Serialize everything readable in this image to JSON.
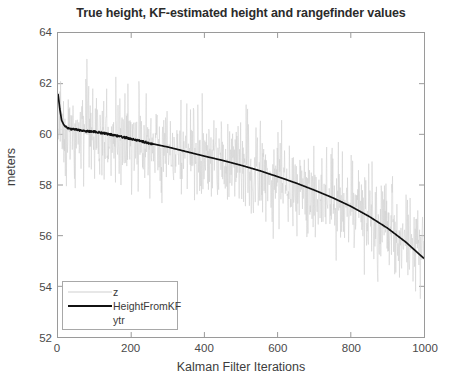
{
  "chart_data": {
    "type": "line",
    "title": "True height, KF-estimated height and rangefinder values",
    "xlabel": "Kalman Filter Iterations",
    "ylabel": "meters",
    "xlim": [
      0,
      1000
    ],
    "ylim": [
      52,
      64
    ],
    "xticks": [
      0,
      200,
      400,
      600,
      800,
      1000
    ],
    "yticks": [
      52,
      54,
      56,
      58,
      60,
      62,
      64
    ],
    "grid": false,
    "legend_position": "lower-left",
    "legend": [
      {
        "label": "z",
        "color": "#cfcfcf",
        "width": 1
      },
      {
        "label": "HeightFromKF",
        "color": "#111111",
        "width": 2
      },
      {
        "label": "ytr",
        "color": "#ffffff",
        "width": 1
      }
    ],
    "series": [
      {
        "name": "z",
        "role": "rangefinder-measurements",
        "color": "#cfcfcf",
        "description": "Noisy rangefinder samples scattered about the true height, spread roughly +/- 1.6 m, densest near the true curve.",
        "noise_sigma": 0.75,
        "x": [
          0,
          50,
          100,
          150,
          200,
          250,
          300,
          350,
          400,
          450,
          500,
          550,
          600,
          650,
          700,
          750,
          800,
          850,
          900,
          950,
          1000
        ],
        "center": [
          60.2,
          60.1,
          60.0,
          59.9,
          59.75,
          59.6,
          59.45,
          59.3,
          59.1,
          58.95,
          58.75,
          58.55,
          58.3,
          58.05,
          57.8,
          57.5,
          57.15,
          56.75,
          56.3,
          55.75,
          55.1
        ]
      },
      {
        "name": "HeightFromKF",
        "role": "kalman-filter-estimate",
        "color": "#111111",
        "description": "Kalman filter estimate; starts with a transient near 61.6 m at iteration 0 then settles onto the true height.",
        "x": [
          0,
          5,
          10,
          15,
          20,
          30,
          40,
          50,
          70,
          100,
          150,
          200,
          250,
          300,
          350,
          400,
          450,
          500,
          550,
          600,
          650,
          700,
          750,
          800,
          850,
          900,
          950,
          1000
        ],
        "y": [
          61.6,
          61.0,
          60.55,
          60.4,
          60.3,
          60.22,
          60.2,
          60.18,
          60.14,
          60.1,
          59.98,
          59.82,
          59.65,
          59.5,
          59.32,
          59.14,
          58.97,
          58.78,
          58.57,
          58.33,
          58.08,
          57.8,
          57.5,
          57.16,
          56.76,
          56.3,
          55.75,
          55.1
        ]
      },
      {
        "name": "ytr",
        "role": "true-height",
        "color": "#dcdcdc",
        "description": "True height trajectory, essentially coincident with and hidden beneath the KF estimate.",
        "x": [
          0,
          100,
          200,
          300,
          400,
          500,
          600,
          700,
          800,
          900,
          1000
        ],
        "y": [
          60.2,
          60.1,
          59.82,
          59.5,
          59.14,
          58.78,
          58.33,
          57.8,
          57.16,
          56.3,
          55.1
        ]
      }
    ]
  }
}
